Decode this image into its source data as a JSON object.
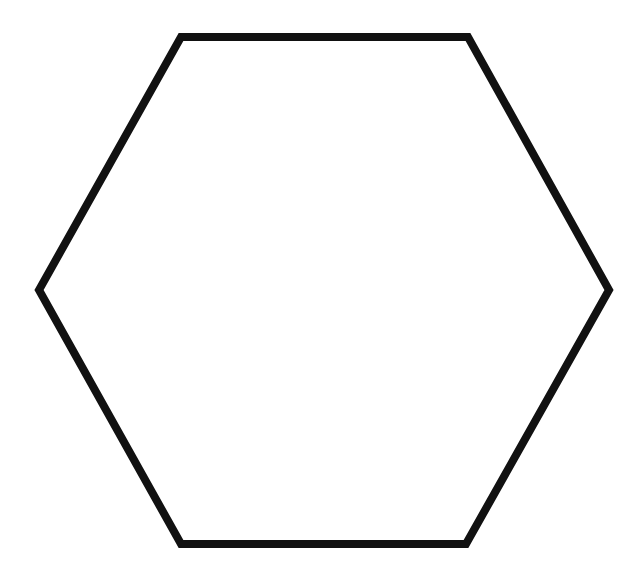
{
  "diagram": {
    "shape": "hexagon",
    "fill": "#ffffff",
    "stroke": "#111111",
    "stroke_width": 8,
    "vertices": [
      [
        181,
        37
      ],
      [
        468,
        37
      ],
      [
        609,
        290
      ],
      [
        466,
        544
      ],
      [
        181,
        544
      ],
      [
        39,
        290
      ]
    ]
  }
}
